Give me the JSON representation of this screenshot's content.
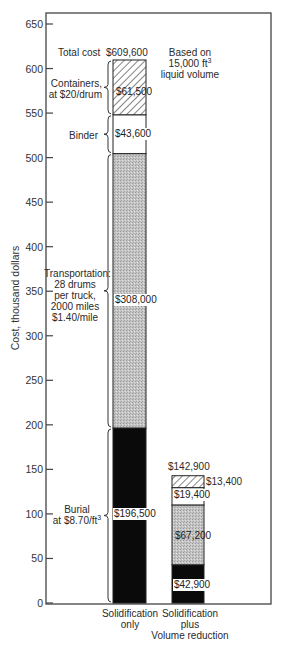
{
  "chart_data": {
    "type": "bar",
    "stacked": true,
    "title": "",
    "xlabel": "",
    "ylabel": "Cost, thousand dollars",
    "ylim": [
      0,
      650
    ],
    "yticks": [
      0,
      50,
      100,
      150,
      200,
      250,
      300,
      350,
      400,
      450,
      500,
      550,
      600,
      650
    ],
    "grid": false,
    "note": "Based on 15,000 ft³ liquid volume",
    "categories": [
      "Solidification only",
      "Solidification plus Volume reduction"
    ],
    "series": [
      {
        "name": "Burial at $8.70/ft³",
        "fill": "solid-black",
        "values": [
          196.5,
          42.9
        ],
        "labels": [
          "$196,500",
          "$42,900"
        ]
      },
      {
        "name": "Transportation: 28 drums per truck, 2000 miles $1.40/mile",
        "fill": "stipple-gray",
        "values": [
          308.0,
          67.2
        ],
        "labels": [
          "$308,000",
          "$67,200"
        ]
      },
      {
        "name": "Binder",
        "fill": "white",
        "values": [
          43.6,
          19.4
        ],
        "labels": [
          "$43,600",
          "$19,400"
        ]
      },
      {
        "name": "Containers, at $20/drum",
        "fill": "diagonal-hatch",
        "values": [
          61.5,
          13.4
        ],
        "labels": [
          "$61,500",
          "$13,400"
        ]
      }
    ],
    "totals": [
      609.6,
      142.9
    ],
    "total_labels": [
      "$609,600",
      "$142,900"
    ]
  },
  "labels": {
    "y_axis": "Cost, thousand dollars",
    "ticks": [
      "0",
      "50",
      "100",
      "150",
      "200",
      "250",
      "300",
      "350",
      "400",
      "450",
      "500",
      "550",
      "600",
      "650"
    ],
    "total_cost": "Total cost",
    "total_1": "$609,600",
    "total_2": "$142,900",
    "note_line1": "Based on",
    "note_line2": "15,000 ft",
    "note_sup": "3",
    "note_line3": "liquid volume",
    "containers_l1": "Containers,",
    "containers_l2": "at $20/drum",
    "binder": "Binder",
    "transport_l1": "Transportation:",
    "transport_l2": "28 drums",
    "transport_l3": "per truck,",
    "transport_l4": "2000 miles",
    "transport_l5": "$1.40/mile",
    "burial_l1": "Burial",
    "burial_l2": "at $8.70/ft",
    "burial_sup": "3",
    "b1_containers": "$61,500",
    "b1_binder": "$43,600",
    "b1_transport": "$308,000",
    "b1_burial": "$196,500",
    "b2_containers": "$13,400",
    "b2_binder": "$19,400",
    "b2_transport": "$67,200",
    "b2_burial": "$42,900",
    "cat1_l1": "Solidification",
    "cat1_l2": "only",
    "cat2_l1": "Solidification",
    "cat2_l2": "plus",
    "cat2_l3": "Volume reduction"
  }
}
